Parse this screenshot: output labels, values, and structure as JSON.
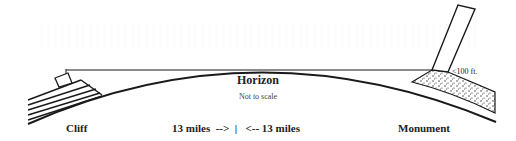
{
  "diagram": {
    "labels": {
      "horizon": "Horizon",
      "scale_note": "Not to scale",
      "cliff": "Cliff",
      "distance": "13 miles  -->  |   <-- 13 miles",
      "monument": "Monument",
      "height": "<100 ft."
    },
    "elements": [
      {
        "id": "cliff",
        "type": "layered-cliff",
        "side": "left"
      },
      {
        "id": "observer",
        "type": "box-on-cliff"
      },
      {
        "id": "sight-line",
        "type": "horizontal-line",
        "from": "observer",
        "to": "monument-base"
      },
      {
        "id": "earth-curve",
        "type": "arc",
        "peak_label": "Horizon"
      },
      {
        "id": "monument",
        "type": "tilted-rectangle",
        "side": "right"
      },
      {
        "id": "mound",
        "type": "stippled-mound",
        "side": "right"
      }
    ],
    "distances": {
      "left_miles": 13,
      "right_miles": 13
    },
    "monument_height_label": "<100 ft.",
    "colors": {
      "ink": "#1a1a1a",
      "background": "#ffffff"
    }
  }
}
